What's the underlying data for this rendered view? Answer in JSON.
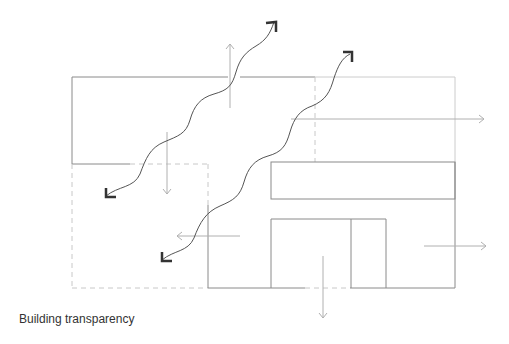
{
  "caption": "Building transparency",
  "colors": {
    "wall": "#8a8a8a",
    "dashed": "#c8c8c8",
    "light_arrow": "#b0b0b0",
    "wave": "#555555",
    "wave_head": "#333333",
    "caption": "#333333"
  },
  "diagram": {
    "type": "building section with light/view flow arrows",
    "elements": [
      {
        "name": "upper-volume",
        "kind": "solid-outline"
      },
      {
        "name": "lower-left-volume",
        "kind": "dashed-outline"
      },
      {
        "name": "right-volume",
        "kind": "mixed-outline"
      },
      {
        "name": "horizontal-band-window",
        "kind": "solid-outline"
      },
      {
        "name": "entrance-doorway",
        "kind": "solid-outline"
      },
      {
        "name": "wave-arrow-1",
        "kind": "double-headed wavy arrow"
      },
      {
        "name": "wave-arrow-2",
        "kind": "double-headed wavy arrow"
      },
      {
        "name": "light-arrows",
        "count": 6
      }
    ]
  }
}
